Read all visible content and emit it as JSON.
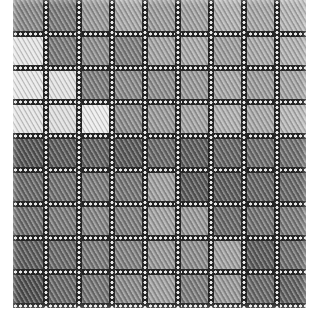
{
  "image": {
    "subject": "woven tweed fabric texture, grayscale",
    "frame": {
      "left": 13,
      "top": 0,
      "width": 293,
      "height": 308
    },
    "grid": {
      "cols": 9,
      "rows": 9,
      "col_pitch": 33,
      "row_pitch": 34,
      "line_width": 6,
      "line_color": "#262626",
      "dot_color": "#e8e8e8"
    },
    "tones": [
      [
        "#8a8a8a",
        "#7c7c7c",
        "#9a9a9a",
        "#a8a8a8",
        "#9c9c9c",
        "#a2a2a2",
        "#b0b0b0",
        "#a6a6a6",
        "#b4b4b4"
      ],
      [
        "#e6e6e6",
        "#7a7a7a",
        "#8e8e8e",
        "#7e7e7e",
        "#a4a4a4",
        "#aaaaaa",
        "#9e9e9e",
        "#a8a8a8",
        "#b0b0b0"
      ],
      [
        "#e8e8e8",
        "#e2e2e2",
        "#7e7e7e",
        "#8a8a8a",
        "#8e8e8e",
        "#9a9a9a",
        "#a6a6a6",
        "#9c9c9c",
        "#a4a4a4"
      ],
      [
        "#e4e4e4",
        "#dedede",
        "#ececec",
        "#8c8c8c",
        "#9a9a9a",
        "#a4a4a4",
        "#b0b0b0",
        "#a8a8a8",
        "#b6b6b6"
      ],
      [
        "#555555",
        "#5c5c5c",
        "#626262",
        "#5a5a5a",
        "#6a6a6a",
        "#5e5e5e",
        "#666666",
        "#6e6e6e",
        "#707070"
      ],
      [
        "#6a6a6a",
        "#727272",
        "#7c7c7c",
        "#767676",
        "#a0a0a0",
        "#5a5a5a",
        "#5e5e5e",
        "#666666",
        "#6a6a6a"
      ],
      [
        "#6e6e6e",
        "#7a7a7a",
        "#868686",
        "#7e7e7e",
        "#a2a2a2",
        "#9a9a9a",
        "#6a6a6a",
        "#727272",
        "#7a7a7a"
      ],
      [
        "#5e5e5e",
        "#6c6c6c",
        "#7a7a7a",
        "#828282",
        "#989898",
        "#8e8e8e",
        "#a2a2a2",
        "#5c5c5c",
        "#707070"
      ],
      [
        "#505050",
        "#6a6a6a",
        "#767676",
        "#8a8a8a",
        "#a0a0a0",
        "#7e7e7e",
        "#9a9a9a",
        "#6a6a6a",
        "#626262"
      ]
    ],
    "highlight_patches": [
      {
        "row": 1,
        "col": 0
      },
      {
        "row": 2,
        "col": 0
      },
      {
        "row": 2,
        "col": 1
      },
      {
        "row": 3,
        "col": 0
      },
      {
        "row": 3,
        "col": 1
      },
      {
        "row": 3,
        "col": 2
      }
    ],
    "background_color": "#ffffff"
  }
}
